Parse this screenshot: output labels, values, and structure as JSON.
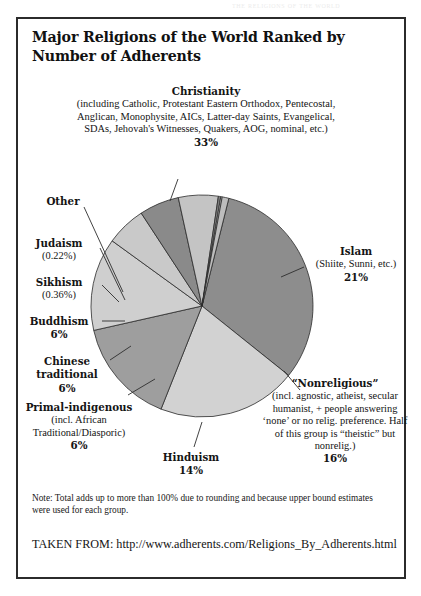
{
  "scan_header": "the religions of the world",
  "title": "Major Religions of the World Ranked by Number of Adherents",
  "labels": {
    "christianity": {
      "name": "Christianity",
      "detail": "(including Catholic, Protestant Eastern Orthodox, Pentecostal, Anglican, Monophysite, AICs, Latter-day Saints, Evangelical, SDAs, Jehovah's Witnesses, Quakers, AOG, nominal, etc.)",
      "value": "33%"
    },
    "islam": {
      "name": "Islam",
      "detail": "(Shiite, Sunni, etc.)",
      "value": "21%"
    },
    "nonreligious": {
      "name": "“Nonreligious”",
      "detail": "(incl. agnostic, atheist, secular humanist, + people answering ‘none’ or no relig. preference. Half of this group is “theistic” but nonrelig.)",
      "value": "16%"
    },
    "hinduism": {
      "name": "Hinduism",
      "detail": "",
      "value": "14%"
    },
    "primal": {
      "name": "Primal-indigenous",
      "detail": "(incl. African Traditional/Diasporic)",
      "value": "6%"
    },
    "chinese": {
      "name": "Chinese traditional",
      "detail": "",
      "value": "6%"
    },
    "buddhism": {
      "name": "Buddhism",
      "detail": "",
      "value": "6%"
    },
    "sikhism": {
      "name": "Sikhism",
      "detail": "",
      "value": "(0.36%)"
    },
    "judaism": {
      "name": "Judaism",
      "detail": "",
      "value": "(0.22%)"
    },
    "other": {
      "name": "Other",
      "detail": "",
      "value": ""
    }
  },
  "note": "Note: Total adds up to more than 100% due to rounding and because upper bound estimates were used for each group.",
  "source": "TAKEN FROM: http://www.adherents.com/Religions_By_Adherents.html",
  "chart_data": {
    "type": "pie",
    "title": "Major Religions of the World Ranked by Number of Adherents",
    "categories": [
      "Christianity",
      "Islam",
      "“Nonreligious”",
      "Hinduism",
      "Primal-indigenous",
      "Chinese traditional",
      "Buddhism",
      "Sikhism",
      "Judaism",
      "Other"
    ],
    "values": [
      33,
      21,
      16,
      14,
      6,
      6,
      6,
      0.36,
      0.22,
      1.0
    ],
    "value_labels": [
      "33%",
      "21%",
      "16%",
      "14%",
      "6%",
      "6%",
      "6%",
      "(0.36%)",
      "(0.22%)",
      ""
    ],
    "slice_colors": [
      "#8d8d8d",
      "#d2d2d2",
      "#9e9e9e",
      "#cfcfcf",
      "#c9c9c9",
      "#8a8a8a",
      "#c4c4c4",
      "#7e7e7e",
      "#cccccc",
      "#bdbdbd"
    ],
    "unit": "percent of world population",
    "start_angle_deg": -76,
    "direction": "clockwise",
    "legend": "none (direct labels with leader lines)",
    "grid": false,
    "note": "Note: Total adds up to more than 100% due to rounding and because upper bound estimates were used for each group.",
    "source": "http://www.adherents.com/Religions_By_Adherents.html"
  }
}
